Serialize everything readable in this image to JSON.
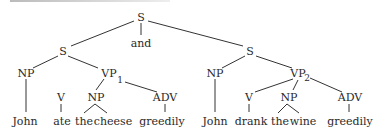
{
  "diagram": {
    "type": "syntax-tree",
    "root": {
      "label": "S"
    },
    "conjunction": "and",
    "left_clause": {
      "label": "S",
      "np": "NP",
      "vp": "VP",
      "vp_subscript": "1",
      "v": "V",
      "obj_np": "NP",
      "adv": "ADV",
      "words": [
        "John",
        "ate",
        "the",
        "cheese",
        "greedily"
      ]
    },
    "right_clause": {
      "label": "S",
      "np": "NP",
      "vp": "VP",
      "vp_subscript": "2",
      "v": "V",
      "obj_np": "NP",
      "adv": "ADV",
      "words": [
        "John",
        "drank",
        "the",
        "wine",
        "greedily"
      ]
    }
  }
}
